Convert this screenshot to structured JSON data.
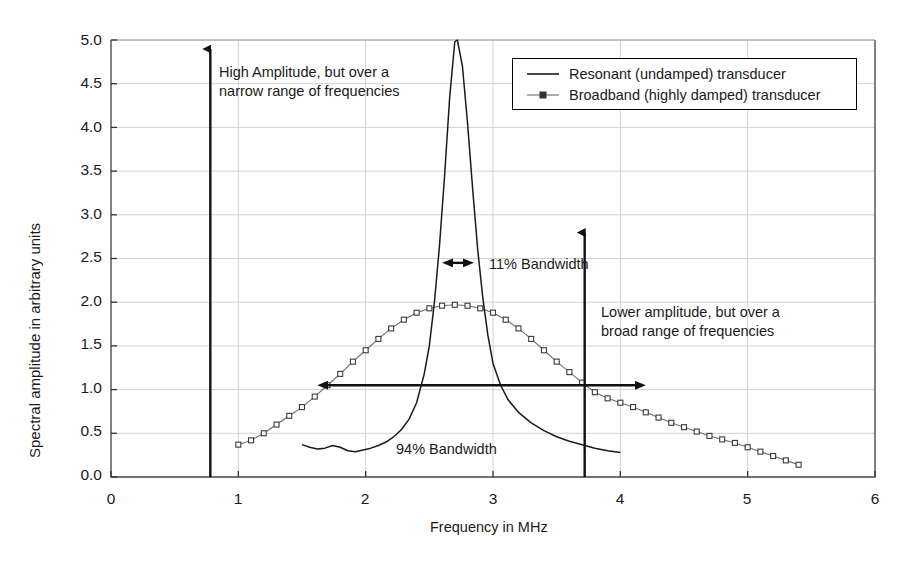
{
  "chart_data": {
    "type": "line",
    "title": "",
    "xlabel": "Frequency in MHz",
    "ylabel": "Spectral amplitude in arbitrary units",
    "xlim": [
      0,
      6
    ],
    "ylim": [
      0,
      5
    ],
    "xticks": [
      "0",
      "1",
      "2",
      "3",
      "4",
      "5",
      "6"
    ],
    "yticks": [
      "0.0",
      "0.5",
      "1.0",
      "1.5",
      "2.0",
      "2.5",
      "3.0",
      "3.5",
      "4.0",
      "4.5",
      "5.0"
    ],
    "grid": "both",
    "legend_position": "top-right",
    "series": [
      {
        "name": "Resonant (undamped) transducer",
        "marker": "none",
        "color": "#1a1a1a",
        "points": [
          [
            1.5,
            0.37
          ],
          [
            1.56,
            0.34
          ],
          [
            1.62,
            0.32
          ],
          [
            1.68,
            0.33
          ],
          [
            1.74,
            0.36
          ],
          [
            1.8,
            0.34
          ],
          [
            1.86,
            0.3
          ],
          [
            1.92,
            0.29
          ],
          [
            1.98,
            0.31
          ],
          [
            2.04,
            0.33
          ],
          [
            2.1,
            0.36
          ],
          [
            2.16,
            0.4
          ],
          [
            2.22,
            0.46
          ],
          [
            2.28,
            0.54
          ],
          [
            2.34,
            0.66
          ],
          [
            2.4,
            0.85
          ],
          [
            2.46,
            1.18
          ],
          [
            2.5,
            1.5
          ],
          [
            2.54,
            2.0
          ],
          [
            2.58,
            2.65
          ],
          [
            2.62,
            3.45
          ],
          [
            2.66,
            4.35
          ],
          [
            2.7,
            4.98
          ],
          [
            2.72,
            5.0
          ],
          [
            2.76,
            4.7
          ],
          [
            2.8,
            4.05
          ],
          [
            2.84,
            3.3
          ],
          [
            2.88,
            2.6
          ],
          [
            2.92,
            2.05
          ],
          [
            2.96,
            1.62
          ],
          [
            3.0,
            1.3
          ],
          [
            3.06,
            1.05
          ],
          [
            3.12,
            0.88
          ],
          [
            3.2,
            0.74
          ],
          [
            3.3,
            0.62
          ],
          [
            3.4,
            0.53
          ],
          [
            3.5,
            0.46
          ],
          [
            3.6,
            0.41
          ],
          [
            3.7,
            0.37
          ],
          [
            3.8,
            0.33
          ],
          [
            3.9,
            0.3
          ],
          [
            4.0,
            0.28
          ]
        ]
      },
      {
        "name": "Broadband (highly damped) transducer",
        "marker": "square",
        "color": "#6e6e6e",
        "points": [
          [
            1.0,
            0.37
          ],
          [
            1.1,
            0.42
          ],
          [
            1.2,
            0.5
          ],
          [
            1.3,
            0.6
          ],
          [
            1.4,
            0.7
          ],
          [
            1.5,
            0.8
          ],
          [
            1.6,
            0.92
          ],
          [
            1.7,
            1.05
          ],
          [
            1.8,
            1.18
          ],
          [
            1.9,
            1.32
          ],
          [
            2.0,
            1.45
          ],
          [
            2.1,
            1.58
          ],
          [
            2.2,
            1.7
          ],
          [
            2.3,
            1.8
          ],
          [
            2.4,
            1.88
          ],
          [
            2.5,
            1.93
          ],
          [
            2.6,
            1.96
          ],
          [
            2.7,
            1.97
          ],
          [
            2.8,
            1.96
          ],
          [
            2.9,
            1.93
          ],
          [
            3.0,
            1.88
          ],
          [
            3.1,
            1.8
          ],
          [
            3.2,
            1.7
          ],
          [
            3.3,
            1.58
          ],
          [
            3.4,
            1.45
          ],
          [
            3.5,
            1.32
          ],
          [
            3.6,
            1.2
          ],
          [
            3.7,
            1.08
          ],
          [
            3.8,
            0.97
          ],
          [
            3.9,
            0.9
          ],
          [
            4.0,
            0.85
          ],
          [
            4.1,
            0.8
          ],
          [
            4.2,
            0.74
          ],
          [
            4.3,
            0.68
          ],
          [
            4.4,
            0.62
          ],
          [
            4.5,
            0.57
          ],
          [
            4.6,
            0.52
          ],
          [
            4.7,
            0.47
          ],
          [
            4.8,
            0.43
          ],
          [
            4.9,
            0.39
          ],
          [
            5.0,
            0.34
          ],
          [
            5.1,
            0.29
          ],
          [
            5.2,
            0.24
          ],
          [
            5.3,
            0.19
          ],
          [
            5.4,
            0.14
          ]
        ]
      }
    ],
    "annotations": [
      {
        "id": "high-amplitude-note",
        "text_line1": "High Amplitude, but over a",
        "text_line2": "narrow range of frequencies",
        "arrow": {
          "type": "vertical-up",
          "x": 0.78,
          "y_from": 0.0,
          "y_to": 5.0
        }
      },
      {
        "id": "lower-amplitude-note",
        "text_line1": "Lower amplitude, but over a",
        "text_line2": "broad range of frequencies",
        "arrow": {
          "type": "vertical-up",
          "x": 3.72,
          "y_from": 0.0,
          "y_to": 2.9
        }
      },
      {
        "id": "narrow-bandwidth-measure",
        "text": "11% Bandwidth",
        "arrow": {
          "type": "double-horizontal",
          "x_from": 2.6,
          "x_to": 2.85,
          "y": 2.45
        }
      },
      {
        "id": "broad-bandwidth-measure",
        "text": "94% Bandwidth",
        "arrow": {
          "type": "double-horizontal",
          "x_from": 1.62,
          "x_to": 4.2,
          "y": 1.05
        }
      }
    ]
  },
  "legend": {
    "entries": [
      {
        "label": "Resonant (undamped) transducer",
        "marker": "line"
      },
      {
        "label": "Broadband (highly damped) transducer",
        "marker": "line-with-square"
      }
    ]
  }
}
